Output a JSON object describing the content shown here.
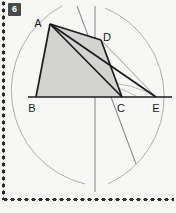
{
  "page": {
    "background_color": "#f7f7f5",
    "width": 176,
    "height": 213
  },
  "badge": {
    "label": "6",
    "background_color": "#4a4a4a",
    "text_color": "#ffffff"
  },
  "figure": {
    "fill_color": "#d3d3d1",
    "stroke_dark": "#1c1c1c",
    "stroke_light": "#9a9a9a",
    "points": {
      "A": {
        "x": 50,
        "y": 24,
        "label": "A",
        "label_x": 38,
        "label_y": 23
      },
      "B": {
        "x": 36,
        "y": 97,
        "label": "B",
        "label_x": 30,
        "label_y": 110
      },
      "C": {
        "x": 122,
        "y": 97,
        "label": "C",
        "label_x": 118,
        "label_y": 110
      },
      "D": {
        "x": 101,
        "y": 40,
        "label": "D",
        "label_x": 103,
        "label_y": 37
      },
      "E": {
        "x": 156,
        "y": 97,
        "label": "E",
        "label_x": 152,
        "label_y": 110
      }
    },
    "baseline": {
      "x1": 28,
      "y1": 97,
      "x2": 172,
      "y2": 97
    },
    "perpendicular_bisector": {
      "x1": 95,
      "y1": 6,
      "x2": 95,
      "y2": 192
    },
    "arc_intersections": [
      {
        "x": 95,
        "y": 10
      },
      {
        "x": 95,
        "y": 183
      }
    ],
    "construction_arcs": [
      {
        "cx": 150,
        "cy": 96,
        "r": 96,
        "name": "arc-from-right"
      },
      {
        "cx": 42,
        "cy": 96,
        "r": 96,
        "name": "arc-from-left"
      }
    ],
    "segments_dark": [
      {
        "name": "AB",
        "from": "A",
        "to": "B"
      },
      {
        "name": "BC",
        "from": "B",
        "to": "C"
      },
      {
        "name": "CD",
        "from": "C",
        "to": "D"
      },
      {
        "name": "DA",
        "from": "D",
        "to": "A"
      },
      {
        "name": "AC",
        "from": "A",
        "to": "C"
      },
      {
        "name": "AE",
        "from": "A",
        "to": "E"
      },
      {
        "name": "CE",
        "from": "C",
        "to": "E"
      }
    ],
    "segments_light": [
      {
        "name": "DE-parallel-helper",
        "from": "D",
        "to": "E"
      },
      {
        "name": "AD-extension-helper",
        "from": "A",
        "to": "E"
      },
      {
        "name": "oblique-construction-line",
        "x1": 77,
        "y1": 6,
        "x2": 135,
        "y2": 163
      }
    ]
  },
  "labels": {
    "A": "A",
    "B": "B",
    "C": "C",
    "D": "D",
    "E": "E"
  }
}
